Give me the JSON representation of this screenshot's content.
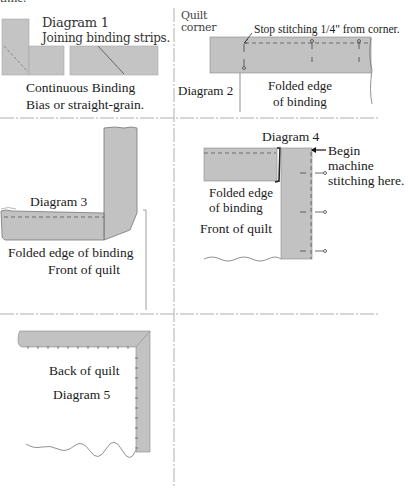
{
  "page": {
    "top_fragment": "time."
  },
  "colors": {
    "binding_fill": "#c2c2c2",
    "binding_stroke": "#7a7a7a",
    "stitch": "#555555",
    "divider": "#9a9a9a",
    "text": "#1a1a1a"
  },
  "diagram1": {
    "title": "Diagram 1",
    "subtitle": "Joining binding strips.",
    "caption_line1": "Continuous Binding",
    "caption_line2": "Bias or straight-grain."
  },
  "diagram2": {
    "corner_label_line1": "Quilt",
    "corner_label_line2": "corner",
    "instruction": "Stop stitching 1/4\" from corner.",
    "title": "Diagram 2",
    "caption_line1": "Folded edge",
    "caption_line2": "of binding"
  },
  "diagram3": {
    "title": "Diagram 3",
    "caption_line1": "Folded edge of binding",
    "caption_line2": "Front of quilt"
  },
  "diagram4": {
    "title": "Diagram 4",
    "instruction_line1": "Begin",
    "instruction_line2": "machine",
    "instruction_line3": "stitching here.",
    "caption_line1": "Folded edge",
    "caption_line2": "of binding",
    "caption_line3": "Front of quilt"
  },
  "diagram5": {
    "caption": "Back of quilt",
    "title": "Diagram 5"
  }
}
